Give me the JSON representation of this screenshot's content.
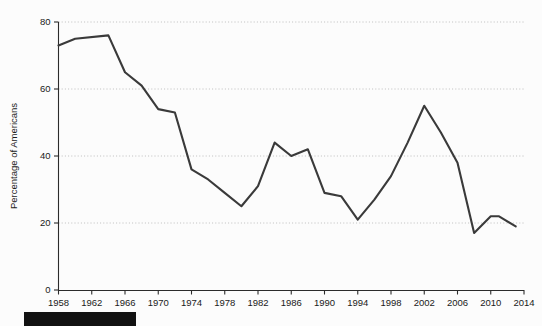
{
  "figure": {
    "background_color": "#fcfcfc",
    "line_color": "#3a3a3a",
    "axis_color": "#2b2b2b",
    "grid_color": "#b8b8b8",
    "redaction_bar_color": "#121212"
  },
  "chart_data": {
    "type": "line",
    "title": "",
    "xlabel": "",
    "ylabel": "Percentage of Americans",
    "xlim": [
      1958,
      2014
    ],
    "ylim": [
      0,
      80
    ],
    "grid": true,
    "grid_axis": "y",
    "legend": "none",
    "xticks": [
      1958,
      1962,
      1966,
      1970,
      1974,
      1978,
      1982,
      1986,
      1990,
      1994,
      1998,
      2002,
      2006,
      2010,
      2014
    ],
    "yticks": [
      0,
      20,
      40,
      60,
      80
    ],
    "x": [
      1958,
      1960,
      1964,
      1966,
      1968,
      1970,
      1972,
      1974,
      1976,
      1978,
      1980,
      1982,
      1984,
      1986,
      1988,
      1990,
      1992,
      1994,
      1996,
      1998,
      2000,
      2002,
      2004,
      2006,
      2008,
      2010,
      2011,
      2013
    ],
    "values": [
      73,
      75,
      76,
      65,
      61,
      54,
      53,
      36,
      33,
      29,
      25,
      31,
      44,
      40,
      42,
      29,
      28,
      21,
      27,
      34,
      44,
      55,
      47,
      38,
      17,
      22,
      22,
      19
    ],
    "series": [
      {
        "name": "Trust in government",
        "values": [
          73,
          75,
          76,
          65,
          61,
          54,
          53,
          36,
          33,
          29,
          25,
          31,
          44,
          40,
          42,
          29,
          28,
          21,
          27,
          34,
          44,
          55,
          47,
          38,
          17,
          22,
          22,
          19
        ]
      }
    ]
  },
  "axes": {
    "y_title": "Percentage of Americans",
    "y_tick_labels": [
      "0",
      "20",
      "40",
      "60",
      "80"
    ],
    "x_tick_labels": [
      "1958",
      "1962",
      "1966",
      "1970",
      "1974",
      "1978",
      "1982",
      "1986",
      "1990",
      "1994",
      "1998",
      "2002",
      "2006",
      "2010",
      "2014"
    ]
  },
  "redaction": {
    "label": ""
  }
}
